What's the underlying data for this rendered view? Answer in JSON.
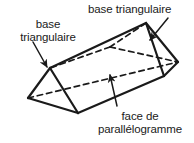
{
  "figure": {
    "type": "triangular-prism-diagram",
    "language": "fr",
    "stroke_color": "#1a1a1a",
    "fill_color": "#ffffff",
    "background": "#ffffff"
  },
  "labels": {
    "base_triangulaire_left": {
      "line1": "base",
      "line2": "triangulaire"
    },
    "base_triangulaire_right": {
      "text": "base triangulaire"
    },
    "face_parallelogramme": {
      "line1": "face de",
      "line2": "parallélogramme"
    }
  },
  "annotations": {
    "leader_left_name": "leader-line-left",
    "leader_right_name": "leader-line-right",
    "leader_bottom_name": "leader-line-bottom"
  }
}
